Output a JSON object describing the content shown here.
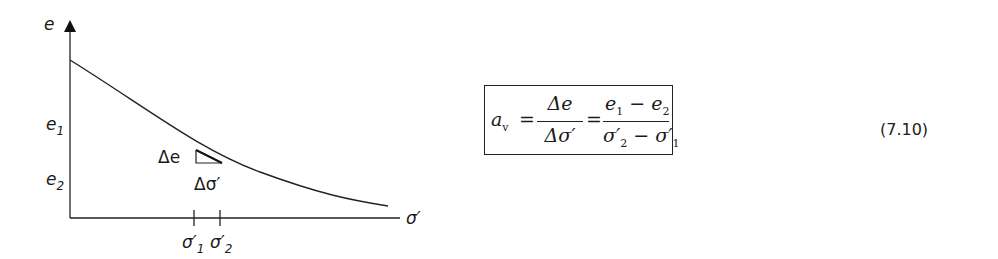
{
  "diagram": {
    "y_axis_label": "e",
    "x_axis_label": "σ′",
    "y_ticks": [
      {
        "base": "e",
        "sub": "1"
      },
      {
        "base": "e",
        "sub": "2"
      }
    ],
    "x_ticks": [
      {
        "base": "σ′",
        "sub": "1"
      },
      {
        "base": "σ′",
        "sub": "2"
      }
    ],
    "delta_e_label": "Δe",
    "delta_sigma_label": "Δσ′",
    "curve": "decreasing e–σ′ compression curve"
  },
  "equation": {
    "lhs_base": "a",
    "lhs_sub": "v",
    "equals": "=",
    "frac1_num": "Δe",
    "frac1_den": "Δσ′",
    "frac2_num_a": "e",
    "frac2_num_a_sub": "1",
    "frac2_minus": "−",
    "frac2_num_b": "e",
    "frac2_num_b_sub": "2",
    "frac2_den_a": "σ′",
    "frac2_den_a_sub": "2",
    "frac2_den_b": "σ′",
    "frac2_den_b_sub": "1",
    "number": "(7.10)"
  }
}
